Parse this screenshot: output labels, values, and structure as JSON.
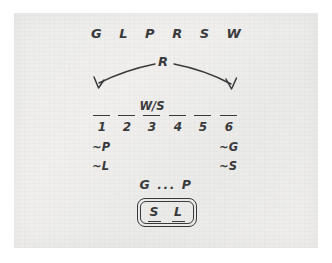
{
  "puzzle": {
    "roster_label": "G L P R S W",
    "pivot_label": "R",
    "slots": [
      {
        "number": "1",
        "above": ""
      },
      {
        "number": "2",
        "above": ""
      },
      {
        "number": "3",
        "above": "W/S"
      },
      {
        "number": "4",
        "above": ""
      },
      {
        "number": "5",
        "above": ""
      },
      {
        "number": "6",
        "above": ""
      }
    ],
    "left_constraints": [
      "~P",
      "~L"
    ],
    "right_constraints": [
      "~G",
      "~S"
    ],
    "sequence_label": "G ... P",
    "answer": {
      "slots": [
        "S",
        "L"
      ]
    }
  },
  "colors": {
    "ink": "#3a3a3c",
    "paper": "#eeedec",
    "page": "#ffffff"
  }
}
